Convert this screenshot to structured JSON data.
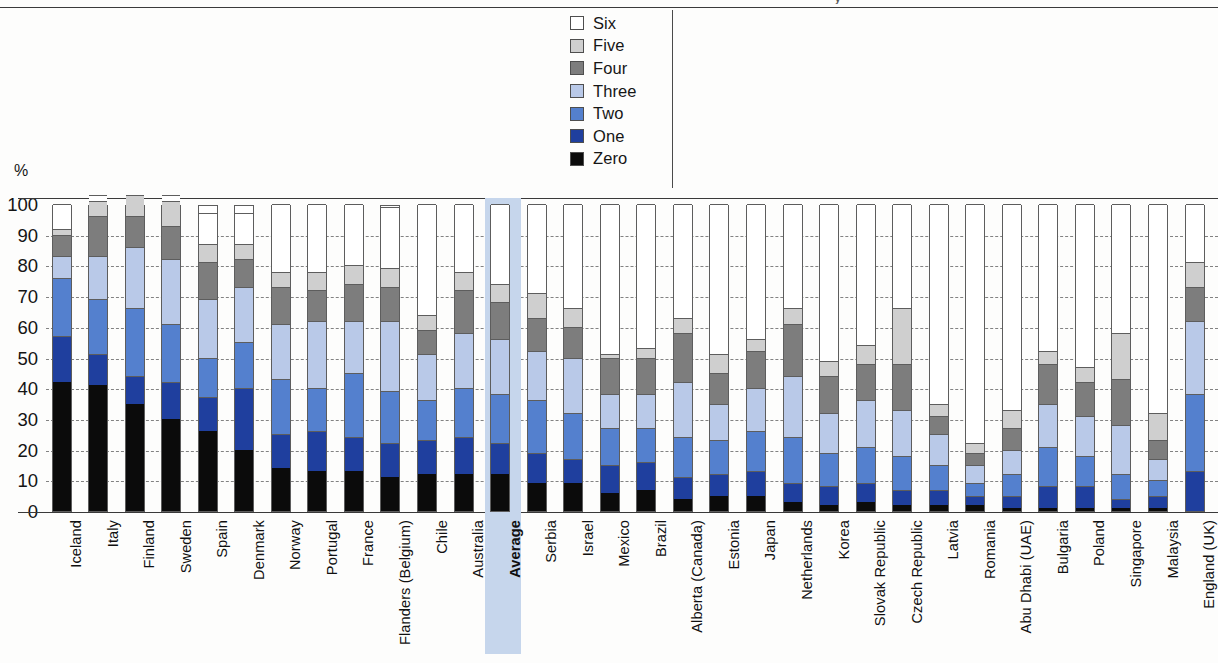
{
  "top_rule": {
    "present": true,
    "title_fragment": "y"
  },
  "legend": {
    "title": "",
    "items": [
      {
        "label": "Six",
        "color": "#ffffff"
      },
      {
        "label": "Five",
        "color": "#cfcfcf"
      },
      {
        "label": "Four",
        "color": "#7d7d7d"
      },
      {
        "label": "Three",
        "color": "#b9c9e8"
      },
      {
        "label": "Two",
        "color": "#5480ce"
      },
      {
        "label": "One",
        "color": "#1f3f9e"
      },
      {
        "label": "Zero",
        "color": "#0b0b0b"
      }
    ]
  },
  "axis": {
    "unit": "%",
    "ticks": [
      "100",
      "90",
      "80",
      "70",
      "60",
      "50",
      "40",
      "30",
      "20",
      "10",
      "0"
    ],
    "min": 0,
    "max": 100
  },
  "chart_data": {
    "type": "bar",
    "subtype": "stacked-100",
    "title": "",
    "xlabel": "",
    "ylabel": "%",
    "ylim": [
      0,
      100
    ],
    "grid": true,
    "legend_position": "top-center",
    "highlighted_category": "Average",
    "series_order": [
      "Zero",
      "One",
      "Two",
      "Three",
      "Four",
      "Five",
      "Six"
    ],
    "series_colors": {
      "Zero": "#0b0b0b",
      "One": "#1f3f9e",
      "Two": "#5480ce",
      "Three": "#b9c9e8",
      "Four": "#7d7d7d",
      "Five": "#cfcfcf",
      "Six": "#ffffff"
    },
    "categories": [
      "Iceland",
      "Italy",
      "Finland",
      "Sweden",
      "Spain",
      "Denmark",
      "Norway",
      "Portugal",
      "France",
      "Flanders (Belgium)",
      "Chile",
      "Australia",
      "Average",
      "Serbia",
      "Israel",
      "Mexico",
      "Brazil",
      "Alberta (Canada)",
      "Estonia",
      "Japan",
      "Netherlands",
      "Korea",
      "Slovak Republic",
      "Czech Republic",
      "Latvia",
      "Romania",
      "Abu Dhabi (UAE)",
      "Bulgaria",
      "Poland",
      "Singapore",
      "Malaysia",
      "England (UK)"
    ],
    "series": [
      {
        "name": "Zero",
        "values": [
          42,
          41,
          35,
          30,
          26,
          20,
          14,
          13,
          13,
          11,
          12,
          12,
          12,
          9,
          9,
          6,
          7,
          4,
          5,
          5,
          3,
          2,
          3,
          2,
          2,
          2,
          1,
          1,
          1,
          1,
          1,
          0
        ]
      },
      {
        "name": "One",
        "values": [
          15,
          10,
          9,
          12,
          11,
          20,
          11,
          13,
          11,
          11,
          11,
          12,
          10,
          10,
          8,
          9,
          9,
          7,
          7,
          8,
          6,
          6,
          6,
          5,
          5,
          3,
          4,
          7,
          7,
          3,
          4,
          13
        ]
      },
      {
        "name": "Two",
        "values": [
          19,
          18,
          22,
          19,
          13,
          15,
          18,
          14,
          21,
          17,
          13,
          16,
          16,
          17,
          15,
          12,
          11,
          13,
          11,
          13,
          15,
          11,
          12,
          11,
          8,
          4,
          7,
          13,
          10,
          8,
          5,
          25
        ]
      },
      {
        "name": "Three",
        "values": [
          7,
          14,
          20,
          21,
          19,
          18,
          18,
          22,
          17,
          23,
          15,
          18,
          18,
          16,
          18,
          11,
          11,
          18,
          12,
          14,
          20,
          13,
          15,
          15,
          10,
          6,
          8,
          14,
          13,
          16,
          7,
          24
        ]
      },
      {
        "name": "Four",
        "values": [
          7,
          13,
          10,
          11,
          12,
          9,
          12,
          10,
          12,
          11,
          8,
          14,
          12,
          11,
          10,
          12,
          12,
          16,
          10,
          12,
          17,
          12,
          12,
          15,
          6,
          4,
          7,
          13,
          11,
          15,
          6,
          11
        ]
      },
      {
        "name": "Five",
        "values": [
          2,
          5,
          7,
          8,
          6,
          5,
          5,
          6,
          6,
          6,
          5,
          6,
          6,
          8,
          6,
          1,
          3,
          5,
          6,
          4,
          5,
          5,
          6,
          18,
          4,
          3,
          6,
          4,
          5,
          15,
          9,
          8
        ]
      },
      {
        "name": "Six",
        "values": [
          8,
          2,
          0,
          2,
          10,
          10,
          22,
          22,
          20,
          20,
          36,
          22,
          26,
          29,
          34,
          49,
          47,
          37,
          49,
          44,
          34,
          51,
          46,
          34,
          65,
          78,
          67,
          48,
          53,
          42,
          68,
          19
        ]
      }
    ]
  }
}
